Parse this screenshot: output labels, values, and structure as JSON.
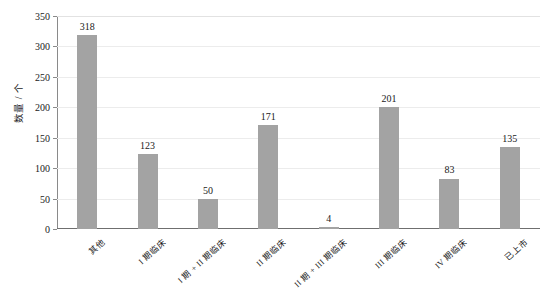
{
  "chart_data": {
    "type": "bar",
    "title": "",
    "xlabel": "",
    "ylabel": "数量 / 个",
    "ylim": [
      0,
      350
    ],
    "ytick_step": 50,
    "yticks": [
      0,
      50,
      100,
      150,
      200,
      250,
      300,
      350
    ],
    "grid": true,
    "legend": null,
    "bar_color": "#a3a3a3",
    "categories": [
      "其他",
      "I 期临床",
      "I 期 + II 期临床",
      "II 期临床",
      "II 期 + III 期临床",
      "III 期临床",
      "IV 期临床",
      "已上市"
    ],
    "values": [
      318,
      123,
      50,
      171,
      4,
      201,
      83,
      135
    ],
    "data_labels": [
      "318",
      "123",
      "50",
      "171",
      "4",
      "201",
      "83",
      "135"
    ]
  },
  "axis": {
    "y_title": "数量 / 个",
    "tick_labels": [
      "350",
      "300",
      "250",
      "200",
      "150",
      "100",
      "50",
      "0"
    ]
  }
}
